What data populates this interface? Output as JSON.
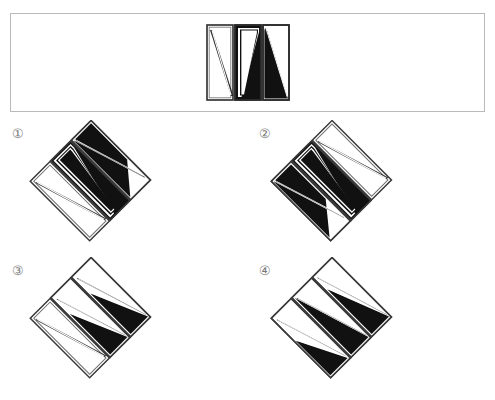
{
  "puzzle": {
    "type": "spatial-rotation-multiple-choice",
    "stimulus": {
      "name": "stimulus-figure",
      "description": "three vertical rectangular panels with diagonal black and white divisions",
      "panels": [
        {
          "id": "left",
          "fill_pattern": "white-with-diagonal-stripe",
          "diagonal": "top-left-to-bottom-right"
        },
        {
          "id": "middle",
          "fill_pattern": "black-with-white-diagonal-band",
          "diagonal": "top-left-to-bottom-right"
        },
        {
          "id": "right",
          "fill_pattern": "black-lower-left-white-upper-right",
          "diagonal": "top-left-to-bottom-right"
        }
      ]
    },
    "options": [
      {
        "number": "①",
        "name": "option-1",
        "rotation_deg": -45,
        "panels": [
          {
            "id": "left",
            "fill": "white"
          },
          {
            "id": "middle",
            "fill": "black"
          },
          {
            "id": "right",
            "fill": "black-upper-white-lower"
          }
        ]
      },
      {
        "number": "②",
        "name": "option-2",
        "rotation_deg": -45,
        "panels": [
          {
            "id": "left",
            "fill": "black-upper-white-lower"
          },
          {
            "id": "middle",
            "fill": "black"
          },
          {
            "id": "right",
            "fill": "white"
          }
        ]
      },
      {
        "number": "③",
        "name": "option-3",
        "rotation_deg": -45,
        "panels": [
          {
            "id": "left",
            "fill": "white"
          },
          {
            "id": "middle",
            "fill": "black-lower"
          },
          {
            "id": "right",
            "fill": "black-lower"
          }
        ]
      },
      {
        "number": "④",
        "name": "option-4",
        "rotation_deg": -45,
        "panels": [
          {
            "id": "left",
            "fill": "white-with-black-lower-triangle"
          },
          {
            "id": "middle",
            "fill": "black"
          },
          {
            "id": "right",
            "fill": "black-lower"
          }
        ]
      }
    ]
  },
  "colors": {
    "fill_black": "#111111",
    "fill_white": "#ffffff",
    "stroke": "#2b2b2b",
    "panel_border": "#b9b9b9",
    "label_text": "#7a7a7a",
    "background": "#ffffff"
  }
}
